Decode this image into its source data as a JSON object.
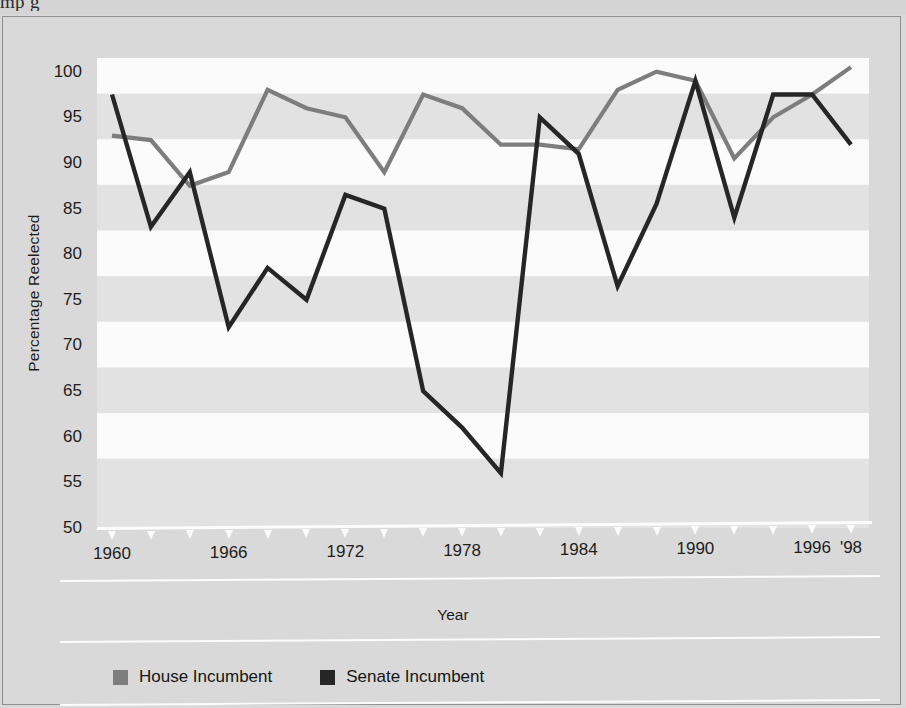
{
  "caption_fragment": "mp                            g",
  "axes": {
    "ylabel": "Percentage Reelected",
    "xlabel": "Year",
    "yticks": [
      100,
      95,
      90,
      85,
      80,
      75,
      70,
      65,
      60,
      55,
      50
    ],
    "xtick_years": [
      1960,
      1962,
      1964,
      1966,
      1968,
      1970,
      1972,
      1974,
      1976,
      1978,
      1980,
      1982,
      1984,
      1986,
      1988,
      1990,
      1992,
      1994,
      1996,
      1998
    ],
    "xtick_labels": [
      {
        "year": 1960,
        "label": "1960"
      },
      {
        "year": 1966,
        "label": "1966"
      },
      {
        "year": 1972,
        "label": "1972"
      },
      {
        "year": 1978,
        "label": "1978"
      },
      {
        "year": 1984,
        "label": "1984"
      },
      {
        "year": 1990,
        "label": "1990"
      },
      {
        "year": 1996,
        "label": "1996"
      },
      {
        "year": 1998,
        "label": "'98"
      }
    ]
  },
  "legend": {
    "items": [
      {
        "label": "House Incumbent",
        "color": "#7d7d7d"
      },
      {
        "label": "Senate Incumbent",
        "color": "#262626"
      }
    ]
  },
  "colors": {
    "house": "#7d7d7d",
    "senate": "#262626",
    "plot_band_light": "#fbfbfb",
    "plot_band_gray": "#e2e2e2",
    "page_background": "#d9d9d9"
  },
  "chart_data": {
    "type": "line",
    "title": "",
    "xlabel": "Year",
    "ylabel": "Percentage Reelected",
    "xlim": [
      1960,
      1998
    ],
    "ylim": [
      50,
      100
    ],
    "grid": "horizontal banded stripes every 5 percentage points",
    "legend_position": "bottom-left",
    "x": [
      1960,
      1962,
      1964,
      1966,
      1968,
      1970,
      1972,
      1974,
      1976,
      1978,
      1980,
      1982,
      1984,
      1986,
      1988,
      1990,
      1992,
      1994,
      1996,
      1998
    ],
    "series": [
      {
        "name": "House Incumbent",
        "color": "#7d7d7d",
        "values": [
          93,
          92.5,
          87.5,
          89,
          98,
          96,
          95,
          89,
          97.5,
          96,
          92,
          92,
          91.5,
          98,
          100,
          99,
          90.5,
          95,
          97.5,
          100.5
        ]
      },
      {
        "name": "Senate Incumbent",
        "color": "#262626",
        "values": [
          97.5,
          83,
          89,
          72,
          78.5,
          75,
          86.5,
          85,
          65,
          61,
          56,
          95,
          91,
          76.5,
          85.5,
          99,
          84,
          97.5,
          97.5,
          92
        ]
      }
    ]
  }
}
